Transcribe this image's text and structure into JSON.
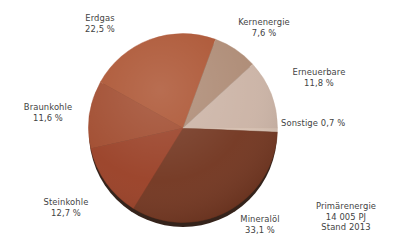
{
  "chart_data": {
    "type": "pie",
    "title": "",
    "unit": "%",
    "start_angle_deg": 0,
    "direction": "clockwise",
    "legend_position": "outside-callout-labels",
    "grid": false,
    "total_label": "Primärenergie",
    "total_value_label": "14 005 PJ",
    "total_year_label": "Stand 2013",
    "categories": [
      "Sonstige",
      "Mineralöl",
      "Steinkohle",
      "Braunkohle",
      "Erdgas",
      "Kernenergie",
      "Erneuerbare"
    ],
    "values": [
      0.7,
      33.1,
      12.7,
      11.6,
      22.5,
      7.6,
      11.8
    ],
    "value_labels": [
      "0,7 %",
      "33,1 %",
      "12,7 %",
      "11,6 %",
      "22,5 %",
      "7,6 %",
      "11,8 %"
    ],
    "colors": [
      "#d6c0b1",
      "#72351f",
      "#993f25",
      "#a04a2d",
      "#ab5230",
      "#ad8a74",
      "#cbb3a5"
    ],
    "slices": [
      {
        "name": "Sonstige",
        "value": 0.7,
        "value_label": "0,7 %",
        "color": "#d6c0b1"
      },
      {
        "name": "Mineralöl",
        "value": 33.1,
        "value_label": "33,1 %",
        "color": "#72351f"
      },
      {
        "name": "Steinkohle",
        "value": 12.7,
        "value_label": "12,7 %",
        "color": "#993f25"
      },
      {
        "name": "Braunkohle",
        "value": 11.6,
        "value_label": "11,6 %",
        "color": "#a04a2d"
      },
      {
        "name": "Erdgas",
        "value": 22.5,
        "value_label": "22,5 %",
        "color": "#ab5230"
      },
      {
        "name": "Kernenergie",
        "value": 7.6,
        "value_label": "7,6 %",
        "color": "#ad8a74"
      },
      {
        "name": "Erneuerbare",
        "value": 11.8,
        "value_label": "11,8 %",
        "color": "#cbb3a5"
      }
    ]
  },
  "labels": {
    "erdgas": {
      "name": "Erdgas",
      "value": "22,5 %"
    },
    "kernenergie": {
      "name": "Kernenergie",
      "value": "7,6 %"
    },
    "erneuerbare": {
      "name": "Erneuerbare",
      "value": "11,8 %"
    },
    "sonstige": {
      "combined": "Sonstige 0,7 %"
    },
    "braunkohle": {
      "name": "Braunkohle",
      "value": "11,6 %"
    },
    "steinkohle": {
      "name": "Steinkohle",
      "value": "12,7 %"
    },
    "mineraloel": {
      "name": "Mineralöl",
      "value": "33,1 %"
    },
    "summary": {
      "line1": "Primärenergie",
      "line2": "14 005 PJ",
      "line3": "Stand 2013"
    }
  },
  "theme": {
    "background": "#ffffff",
    "text_color": "#434343",
    "shadow_color": "#241008"
  }
}
